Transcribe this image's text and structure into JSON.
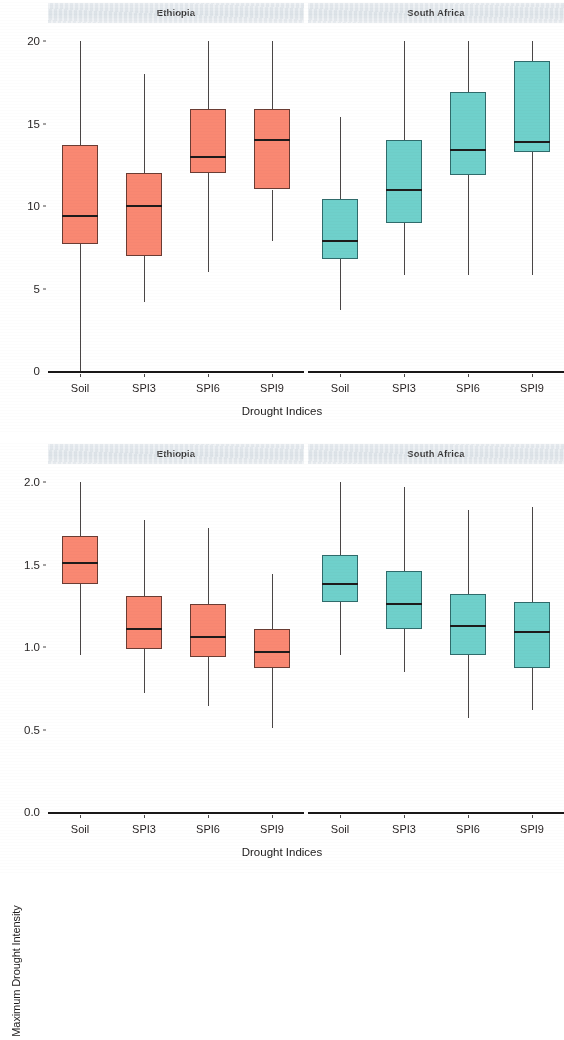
{
  "figure": {
    "panel_labels": [
      "Ethiopia",
      "South Africa"
    ],
    "colors": {
      "ethiopia_fill": "#F98872",
      "south_africa_fill": "#6FD0CB",
      "strip_background": "#E4E9EE",
      "median_line": "#1d1b1b",
      "axis_line": "#1a1818"
    }
  },
  "chart_data": [
    {
      "type": "boxplot",
      "title": "Maximum Drought Duration (month)",
      "xlabel": "Drought Indices",
      "ylabel": "Maximum Drought Duration (month)",
      "ylim": [
        0,
        20
      ],
      "yticks": [
        0,
        5,
        10,
        15,
        20
      ],
      "ytick_labels": [
        "0",
        "5",
        "10",
        "15",
        "20"
      ],
      "grid": false,
      "legend": "none",
      "categories": [
        "Soil",
        "SPI3",
        "SPI6",
        "SPI9"
      ],
      "panels": [
        {
          "name": "Ethiopia",
          "color": "#F98872",
          "boxes": [
            {
              "category": "Soil",
              "whisker_low": 0.0,
              "q1": 7.7,
              "median": 9.4,
              "q3": 13.7,
              "whisker_high": 20.0
            },
            {
              "category": "SPI3",
              "whisker_low": 4.2,
              "q1": 7.0,
              "median": 10.0,
              "q3": 12.0,
              "whisker_high": 18.0
            },
            {
              "category": "SPI6",
              "whisker_low": 6.0,
              "q1": 12.0,
              "median": 13.0,
              "q3": 15.9,
              "whisker_high": 20.0
            },
            {
              "category": "SPI9",
              "whisker_low": 7.9,
              "q1": 11.0,
              "median": 14.0,
              "q3": 15.9,
              "whisker_high": 20.0
            }
          ]
        },
        {
          "name": "South Africa",
          "color": "#6FD0CB",
          "boxes": [
            {
              "category": "Soil",
              "whisker_low": 3.7,
              "q1": 6.8,
              "median": 7.9,
              "q3": 10.4,
              "whisker_high": 15.4
            },
            {
              "category": "SPI3",
              "whisker_low": 5.8,
              "q1": 9.0,
              "median": 11.0,
              "q3": 14.0,
              "whisker_high": 20.0
            },
            {
              "category": "SPI6",
              "whisker_low": 5.8,
              "q1": 11.9,
              "median": 13.4,
              "q3": 16.9,
              "whisker_high": 20.0
            },
            {
              "category": "SPI9",
              "whisker_low": 5.8,
              "q1": 13.3,
              "median": 13.9,
              "q3": 18.8,
              "whisker_high": 20.0
            }
          ]
        }
      ]
    },
    {
      "type": "boxplot",
      "title": "Maximum Drought Intensity",
      "xlabel": "Drought Indices",
      "ylabel": "Maximum Drought Intensity",
      "ylim": [
        0.0,
        2.0
      ],
      "yticks": [
        0.0,
        0.5,
        1.0,
        1.5,
        2.0
      ],
      "ytick_labels": [
        "0.0",
        "0.5",
        "1.0",
        "1.5",
        "2.0"
      ],
      "grid": false,
      "legend": "none",
      "categories": [
        "Soil",
        "SPI3",
        "SPI6",
        "SPI9"
      ],
      "panels": [
        {
          "name": "Ethiopia",
          "color": "#F98872",
          "boxes": [
            {
              "category": "Soil",
              "whisker_low": 0.95,
              "q1": 1.38,
              "median": 1.51,
              "q3": 1.67,
              "whisker_high": 2.0
            },
            {
              "category": "SPI3",
              "whisker_low": 0.72,
              "q1": 0.99,
              "median": 1.11,
              "q3": 1.31,
              "whisker_high": 1.77
            },
            {
              "category": "SPI6",
              "whisker_low": 0.64,
              "q1": 0.94,
              "median": 1.06,
              "q3": 1.26,
              "whisker_high": 1.72
            },
            {
              "category": "SPI9",
              "whisker_low": 0.51,
              "q1": 0.87,
              "median": 0.97,
              "q3": 1.11,
              "whisker_high": 1.44
            }
          ]
        },
        {
          "name": "South Africa",
          "color": "#6FD0CB",
          "boxes": [
            {
              "category": "Soil",
              "whisker_low": 0.95,
              "q1": 1.27,
              "median": 1.38,
              "q3": 1.56,
              "whisker_high": 2.0
            },
            {
              "category": "SPI3",
              "whisker_low": 0.85,
              "q1": 1.11,
              "median": 1.26,
              "q3": 1.46,
              "whisker_high": 1.97
            },
            {
              "category": "SPI6",
              "whisker_low": 0.57,
              "q1": 0.95,
              "median": 1.13,
              "q3": 1.32,
              "whisker_high": 1.83
            },
            {
              "category": "SPI9",
              "whisker_low": 0.62,
              "q1": 0.87,
              "median": 1.09,
              "q3": 1.27,
              "whisker_high": 1.85
            }
          ]
        }
      ]
    }
  ]
}
